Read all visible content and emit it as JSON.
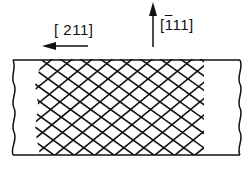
{
  "labels": {
    "direction_horizontal": "[ 211]",
    "direction_vertical_prefix": "[",
    "direction_vertical_bar_digit": "1",
    "direction_vertical_rest": "11]"
  },
  "colors": {
    "ink": "#111111",
    "background": "#ffffff"
  }
}
